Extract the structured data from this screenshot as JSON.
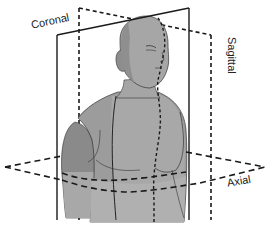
{
  "figure": {
    "labels": {
      "coronal": "Coronal",
      "sagittal": "Sagittal",
      "axial": "Axial"
    },
    "colors": {
      "background": "#ffffff",
      "line": "#1a1a1a",
      "skin_light": "#a9a9a9",
      "skin_mid": "#9a9a9a",
      "skin_dark": "#7f7f7f",
      "skin_lower": "#b3b3b3"
    },
    "planes": [
      {
        "name": "Coronal",
        "style": "solid"
      },
      {
        "name": "Sagittal",
        "style": "dashed"
      },
      {
        "name": "Axial",
        "style": "dashed"
      }
    ]
  }
}
